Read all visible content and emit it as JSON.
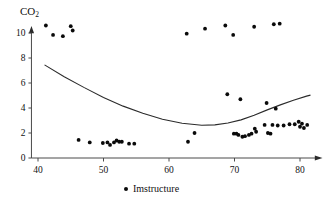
{
  "chart_data": {
    "type": "scatter",
    "title": "",
    "ylabel": "CO2",
    "ylabel_base": "CO",
    "ylabel_sub": "2",
    "xlabel": "",
    "xlim": [
      38.5,
      82.5
    ],
    "ylim": [
      0,
      10.9
    ],
    "xticks": [
      40,
      50,
      60,
      70,
      80
    ],
    "yticks": [
      0,
      2,
      4,
      6,
      8,
      10
    ],
    "grid": false,
    "legend_position": "bottom-center",
    "legend": [
      {
        "label": "Imstructure",
        "marker": "filled-circle",
        "color": "#0a0a0a"
      }
    ],
    "series": [
      {
        "name": "Imstructure",
        "type": "scatter",
        "color": "#0a0a0a",
        "points": [
          [
            41.2,
            10.6
          ],
          [
            42.3,
            9.85
          ],
          [
            43.8,
            9.75
          ],
          [
            45.0,
            10.55
          ],
          [
            45.3,
            10.2
          ],
          [
            46.2,
            1.45
          ],
          [
            47.9,
            1.25
          ],
          [
            49.9,
            1.2
          ],
          [
            50.6,
            1.25
          ],
          [
            51.0,
            1.05
          ],
          [
            51.6,
            1.25
          ],
          [
            52.0,
            1.4
          ],
          [
            52.4,
            1.3
          ],
          [
            52.8,
            1.3
          ],
          [
            53.9,
            1.15
          ],
          [
            54.7,
            1.15
          ],
          [
            62.7,
            9.95
          ],
          [
            62.9,
            1.3
          ],
          [
            63.9,
            2.0
          ],
          [
            65.5,
            10.35
          ],
          [
            68.6,
            10.6
          ],
          [
            68.9,
            5.1
          ],
          [
            69.8,
            9.85
          ],
          [
            69.9,
            1.95
          ],
          [
            70.3,
            1.95
          ],
          [
            70.6,
            1.85
          ],
          [
            70.9,
            4.7
          ],
          [
            71.2,
            1.7
          ],
          [
            71.6,
            1.75
          ],
          [
            72.2,
            1.85
          ],
          [
            72.6,
            1.95
          ],
          [
            73.0,
            10.5
          ],
          [
            73.1,
            2.35
          ],
          [
            73.3,
            2.1
          ],
          [
            74.6,
            2.65
          ],
          [
            74.9,
            4.4
          ],
          [
            75.1,
            2.0
          ],
          [
            75.5,
            1.95
          ],
          [
            75.8,
            2.65
          ],
          [
            76.0,
            10.7
          ],
          [
            76.3,
            3.95
          ],
          [
            76.6,
            2.6
          ],
          [
            76.9,
            10.75
          ],
          [
            77.5,
            2.6
          ],
          [
            78.4,
            2.7
          ],
          [
            79.2,
            2.7
          ],
          [
            79.8,
            2.9
          ],
          [
            80.0,
            2.5
          ],
          [
            80.3,
            2.75
          ],
          [
            80.6,
            2.4
          ],
          [
            81.1,
            2.65
          ]
        ]
      },
      {
        "name": "quadratic-fit",
        "type": "line",
        "color": "#2b2b2b",
        "note": "fitted quadratic trend curve, minimum near x=65",
        "points": [
          [
            41.0,
            7.45
          ],
          [
            44.0,
            6.5
          ],
          [
            47.0,
            5.65
          ],
          [
            50.0,
            4.85
          ],
          [
            53.0,
            4.15
          ],
          [
            56.0,
            3.58
          ],
          [
            59.0,
            3.1
          ],
          [
            62.0,
            2.78
          ],
          [
            65.0,
            2.62
          ],
          [
            67.0,
            2.65
          ],
          [
            69.0,
            2.8
          ],
          [
            71.0,
            3.05
          ],
          [
            73.0,
            3.42
          ],
          [
            75.0,
            3.85
          ],
          [
            77.0,
            4.25
          ],
          [
            79.0,
            4.62
          ],
          [
            81.0,
            4.95
          ],
          [
            81.6,
            5.03
          ]
        ]
      }
    ]
  },
  "legend": {
    "marker_name": "legend-marker-dot",
    "label": "Imstructure"
  },
  "axes": {
    "y_title_base": "CO",
    "y_title_sub": "2"
  }
}
